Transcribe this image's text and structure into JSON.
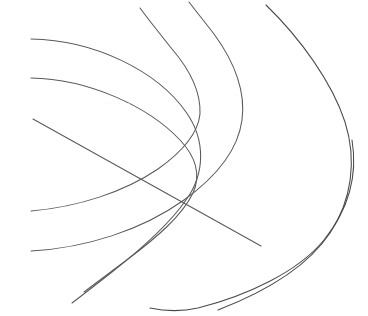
{
  "canvas": {
    "width": 368,
    "height": 316,
    "background_color": "#ffffff",
    "title": "Line drawing of nested open curves"
  },
  "style": {
    "stroke_color": "#59595c",
    "stroke_color_dark": "#4a4a4e",
    "stroke_width": 1.05,
    "faint_color": "#efeef0"
  },
  "figure": {
    "curves": [
      {
        "id": "arc-outer-top",
        "name": "outermost-upper-arc",
        "stroke": "#59595c",
        "width": 1.05,
        "d": "M 31 39 C 96 40 158 72 186 112 C 206 140 205 174 186 200 C 168 226 140 250 112 272 C 98 283 84 294 72 303"
      },
      {
        "id": "arc-inner-top",
        "name": "inner-upper-arc",
        "stroke": "#59595c",
        "width": 1.05,
        "d": "M 31 78 C 88 79 148 106 180 140 C 196 157 201 175 193 193 C 182 216 156 238 128 259 C 112 271 96 283 84 292"
      },
      {
        "id": "arc-inner-lower",
        "name": "inner-lower-arc",
        "stroke": "#59595c",
        "width": 1.05,
        "d": "M 31 211 C 78 207 124 192 158 169 C 182 152 198 134 200 114 C 201 92 190 70 172 49 C 160 34 148 19 140 8"
      },
      {
        "id": "arc-outer-lower",
        "name": "outermost-lower-arc",
        "stroke": "#59595c",
        "width": 1.05,
        "d": "M 31 251 C 86 248 142 230 184 200 C 216 177 238 150 242 120 C 246 90 233 60 214 34 C 204 21 195 10 189 2"
      },
      {
        "id": "arc-right-outer",
        "name": "right-outer-sweep-arc",
        "stroke": "#4a4a4e",
        "width": 1.05,
        "d": "M 266 5 C 300 38 332 82 345 122 C 357 160 352 200 330 233 C 306 269 262 293 218 310"
      },
      {
        "id": "arc-right-inner",
        "name": "right-inner-sweep-arc",
        "stroke": "#4a4a4e",
        "width": 1.05,
        "d": "M 352 140 C 358 176 348 210 324 240 C 298 272 246 296 198 308 C 180 312 164 311 150 308"
      }
    ],
    "lines": [
      {
        "id": "diagonal-chord",
        "name": "straight-diagonal-line",
        "stroke": "#59595c",
        "width": 1.05,
        "x1": 33,
        "y1": 119,
        "x2": 261,
        "y2": 246
      }
    ],
    "faint_marks": [
      {
        "id": "faint-text-upper",
        "name": "faint-pencil-smudge",
        "text": "· · ·",
        "x": 108,
        "y": 98
      },
      {
        "id": "faint-text-lower",
        "name": "faint-pencil-dot",
        "text": "·",
        "x": 48,
        "y": 208
      }
    ]
  }
}
